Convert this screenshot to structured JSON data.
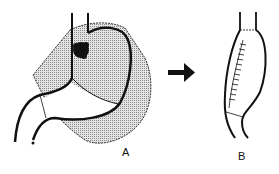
{
  "figure": {
    "panels": [
      {
        "id": "A",
        "label": "A",
        "description": "Stomach with shaded resection region and dark tumor near cardia"
      },
      {
        "id": "B",
        "label": "B",
        "description": "Tubular stomach after resection with staple line"
      }
    ],
    "arrow": {
      "direction": "right",
      "from": "A",
      "to": "B"
    },
    "colors": {
      "line": "#111111",
      "shade": "#bdbdbd",
      "background": "#ffffff"
    }
  }
}
